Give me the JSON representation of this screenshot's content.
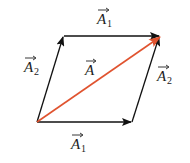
{
  "diagram": {
    "colors": {
      "component": "#111111",
      "resultant": "#e0532f"
    },
    "labels": {
      "top": {
        "base": "A",
        "sub": "1"
      },
      "bottom": {
        "base": "A",
        "sub": "1"
      },
      "left": {
        "base": "A",
        "sub": "2"
      },
      "right": {
        "base": "A",
        "sub": "2"
      },
      "center": {
        "base": "A",
        "sub": ""
      }
    }
  }
}
